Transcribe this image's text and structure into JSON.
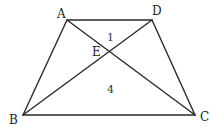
{
  "diagram": {
    "type": "geometry-trapezoid",
    "points": {
      "A": {
        "label": "A",
        "x": 67,
        "y": 20
      },
      "D": {
        "label": "D",
        "x": 152,
        "y": 20
      },
      "B": {
        "label": "B",
        "x": 23,
        "y": 115
      },
      "C": {
        "label": "C",
        "x": 195,
        "y": 115
      },
      "E": {
        "label": "E",
        "x": 110,
        "y": 51
      }
    },
    "segments": [
      {
        "from": "A",
        "to": "D",
        "name": "AD"
      },
      {
        "from": "D",
        "to": "C",
        "name": "DC"
      },
      {
        "from": "C",
        "to": "B",
        "name": "CB"
      },
      {
        "from": "B",
        "to": "A",
        "name": "BA"
      },
      {
        "from": "A",
        "to": "C",
        "name": "AC"
      },
      {
        "from": "B",
        "to": "D",
        "name": "BD"
      }
    ],
    "regions": [
      {
        "name": "triangle-AED",
        "label": "1"
      },
      {
        "name": "triangle-BEC",
        "label": "4"
      }
    ],
    "colors": {
      "stroke": "#2a2a2a",
      "text": "#222222",
      "background": "#ffffff"
    }
  }
}
